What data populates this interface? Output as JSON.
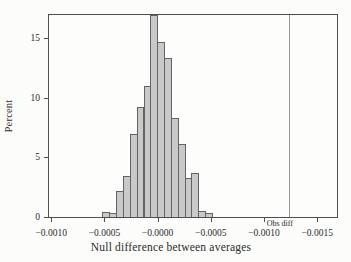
{
  "chart_data": {
    "type": "bar",
    "subtype": "histogram",
    "title": "",
    "xlabel": "Null difference between averages",
    "ylabel": "Percent",
    "y_ticks": [
      0,
      5,
      10,
      15
    ],
    "ylim": [
      0,
      17.1
    ],
    "x_tick_labels": [
      "−0.0010",
      "−0.0005",
      "−0.0000",
      "−0.0005",
      "−0.0010",
      "−0.0015"
    ],
    "x_tick_fractions": [
      0.011,
      0.1945,
      0.3779,
      0.5614,
      0.7448,
      0.9283
    ],
    "values_percent": [
      0.4,
      0.3,
      2.2,
      3.4,
      7.0,
      9.2,
      11.0,
      16.9,
      14.7,
      13.3,
      8.3,
      6.1,
      3.3,
      3.7,
      0.5,
      0.3
    ],
    "bars_start_fraction": 0.1876,
    "bar_width_fraction": 0.02362,
    "annotation": {
      "label": "Obs diff",
      "x_fraction": 0.8276
    },
    "legend": {
      "visible": false
    },
    "grid": false,
    "colors": {
      "bar_fill": "#c9c9c9",
      "bar_border": "#636363",
      "frame": "#4f4f4f",
      "obs_line": "#9a9a9a",
      "text": "#2b2b2b"
    }
  }
}
